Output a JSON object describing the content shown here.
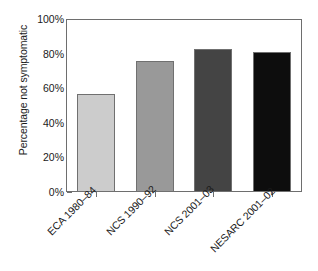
{
  "chart_data": {
    "type": "bar",
    "title": "",
    "xlabel": "",
    "ylabel": "Percentage not symptomatic",
    "categories": [
      "ECA 1980–84",
      "NCS 1990–92",
      "NCS 2001–03",
      "NESARC 2001–02"
    ],
    "values": [
      57,
      76,
      83,
      81.5
    ],
    "value_labels": [
      "57%",
      "76%",
      "83%",
      "81%"
    ],
    "ylim": [
      0,
      100
    ],
    "ytick_labels": [
      "0%",
      "20%",
      "40%",
      "60%",
      "80%",
      "100%"
    ],
    "ytick_values": [
      0,
      20,
      40,
      60,
      80,
      100
    ],
    "grid": false,
    "legend": "none",
    "bar_colors": [
      "#cccccc",
      "#999999",
      "#444444",
      "#0d0d0d"
    ],
    "bar_edge_color": "#707070",
    "axis_color": "#6e6e6e",
    "text_color": "#1a1a1a"
  }
}
